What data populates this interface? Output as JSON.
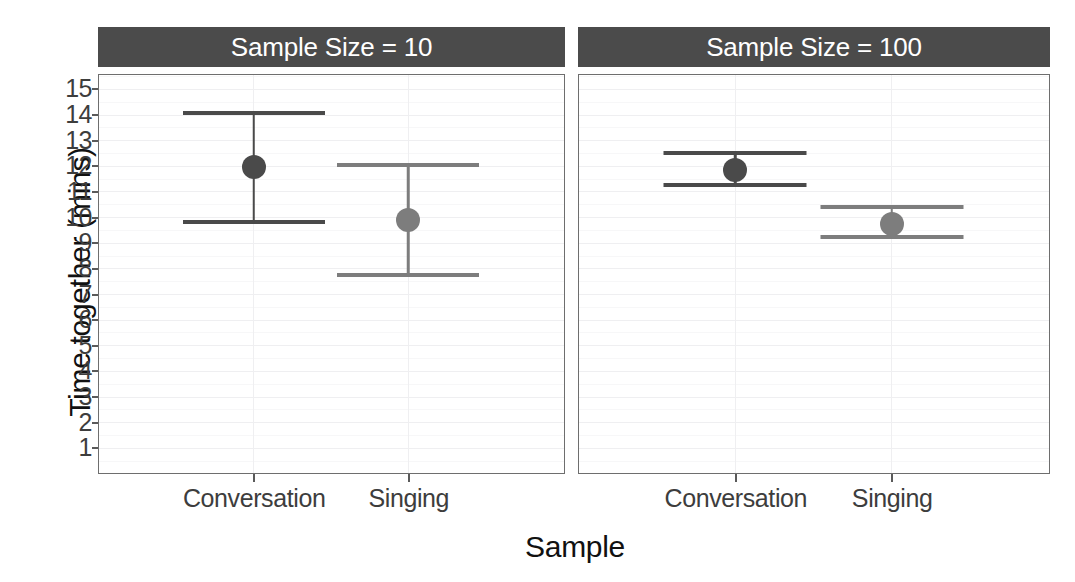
{
  "chart_data": {
    "type": "scatter",
    "title": "",
    "xlabel": "Sample",
    "ylabel": "Time together (mins)",
    "categories": [
      "Conversation",
      "Singing"
    ],
    "ylim": [
      0,
      15.6
    ],
    "yticks": [
      1,
      2,
      3,
      4,
      5,
      6,
      7,
      8,
      9,
      10,
      11,
      12,
      13,
      14,
      15
    ],
    "ytick_labels": [
      "1",
      "2",
      "3",
      "4",
      "5",
      "6",
      "7",
      "8",
      "9",
      "10",
      "11",
      "12",
      "13",
      "14",
      "15"
    ],
    "grid": true,
    "legend": "none",
    "facet_variable": "Sample Size",
    "facets": [
      {
        "label": "Sample Size = 10",
        "points": [
          {
            "category": "Conversation",
            "mean": 12.0,
            "ci_low": 9.85,
            "ci_high": 14.1,
            "color": "#4a4a4a"
          },
          {
            "category": "Singing",
            "mean": 9.95,
            "ci_low": 7.8,
            "ci_high": 12.1,
            "color": "#7d7d7d"
          }
        ]
      },
      {
        "label": "Sample Size = 100",
        "points": [
          {
            "category": "Conversation",
            "mean": 11.9,
            "ci_low": 11.3,
            "ci_high": 12.55,
            "color": "#4a4a4a"
          },
          {
            "category": "Singing",
            "mean": 9.8,
            "ci_low": 9.3,
            "ci_high": 10.45,
            "color": "#7d7d7d"
          }
        ]
      }
    ]
  },
  "style": {
    "strip_background": "#4b4b4b",
    "strip_text_color": "#ffffff",
    "panel_background": "#ffffff",
    "panel_border": "#6e6e6e",
    "gridline_major": "#efeff1",
    "gridline_minor": "#f7f7f8",
    "axis_text_color": "#3d3d3d",
    "axis_title_color": "#111111"
  }
}
